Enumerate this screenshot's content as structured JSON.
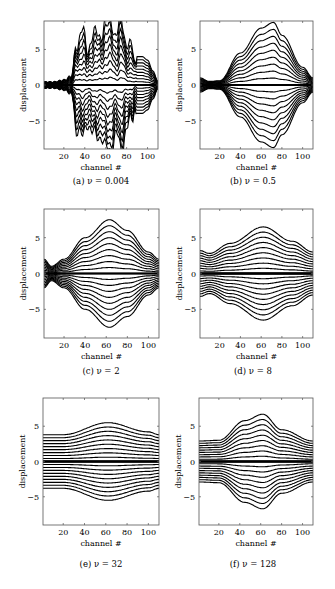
{
  "figure": {
    "panels": [
      {
        "id": "a",
        "caption": "(a) ν = 0.004",
        "box": {
          "x": 44,
          "y": 21,
          "w": 114,
          "h": 128
        },
        "caption_pos": {
          "x": 101,
          "y": 182
        }
      },
      {
        "id": "b",
        "caption": "(b) ν = 0.5",
        "box": {
          "x": 200,
          "y": 21,
          "w": 113,
          "h": 128
        },
        "caption_pos": {
          "x": 253,
          "y": 182
        }
      },
      {
        "id": "c",
        "caption": "(c) ν = 2",
        "box": {
          "x": 44,
          "y": 209,
          "w": 115,
          "h": 129
        },
        "caption_pos": {
          "x": 101,
          "y": 372
        }
      },
      {
        "id": "d",
        "caption": "(d) ν = 8",
        "box": {
          "x": 200,
          "y": 209,
          "w": 113,
          "h": 129
        },
        "caption_pos": {
          "x": 253,
          "y": 372
        }
      },
      {
        "id": "e",
        "caption": "(e) ν = 32",
        "box": {
          "x": 43,
          "y": 398,
          "w": 116,
          "h": 127
        },
        "caption_pos": {
          "x": 101,
          "y": 565
        }
      },
      {
        "id": "f",
        "caption": "(f) ν = 128",
        "box": {
          "x": 199,
          "y": 398,
          "w": 114,
          "h": 127
        },
        "caption_pos": {
          "x": 253,
          "y": 565
        }
      }
    ]
  },
  "chart_data": [
    {
      "type": "line",
      "title": "(a) ν = 0.004",
      "xlabel": "channel #",
      "ylabel": "displacement",
      "xlim": [
        1,
        110
      ],
      "ylim": [
        -9,
        9
      ],
      "xticks": [
        20,
        40,
        60,
        80,
        100
      ],
      "yticks": [
        -5,
        0,
        5
      ],
      "grid": false,
      "legend": null,
      "description": "~20 displacement traces, noisy and irregular; near zero for channels 1-25, large jagged excursions for channels 30-88 (reaching ±9 and clipped), narrow band ±4 for channels 88-108",
      "envelope": {
        "x": [
          1,
          10,
          20,
          28,
          32,
          38,
          42,
          48,
          55,
          60,
          65,
          70,
          75,
          80,
          85,
          88,
          90,
          95,
          100,
          105,
          110
        ],
        "max": [
          0.5,
          0.5,
          0.8,
          1.5,
          6,
          7.5,
          5,
          7,
          7,
          9,
          9,
          7,
          9,
          6,
          5,
          3,
          4,
          4,
          3.5,
          2,
          0.5
        ]
      }
    },
    {
      "type": "line",
      "title": "(b) ν = 0.5",
      "xlabel": "channel #",
      "ylabel": "displacement",
      "xlim": [
        1,
        110
      ],
      "ylim": [
        -9,
        9
      ],
      "xticks": [
        20,
        40,
        60,
        80,
        100
      ],
      "yticks": [
        -5,
        0,
        5
      ],
      "grid": false,
      "legend": null,
      "description": "~20 smooth traces symmetric about 0; bundle narrow (±1) near channels 1-20, widening to ±8.8 near channel 72, then narrowing to ±1 at 110",
      "envelope": {
        "x": [
          1,
          10,
          20,
          40,
          60,
          72,
          80,
          100,
          110
        ],
        "max": [
          1,
          0.5,
          0.6,
          4.5,
          8,
          8.8,
          7,
          2.5,
          1
        ]
      }
    },
    {
      "type": "line",
      "title": "(c) ν = 2",
      "xlabel": "channel #",
      "ylabel": "displacement",
      "xlim": [
        1,
        110
      ],
      "ylim": [
        -9,
        9
      ],
      "xticks": [
        20,
        40,
        60,
        80,
        100
      ],
      "yticks": [
        -5,
        0,
        5
      ],
      "grid": false,
      "legend": null,
      "description": "~20 smooth bell-shaped traces symmetric about 0, peak ±7.5 near channel 63",
      "envelope": {
        "x": [
          1,
          8,
          20,
          40,
          63,
          80,
          100,
          110
        ],
        "max": [
          2,
          1,
          2,
          5,
          7.5,
          6,
          3,
          2
        ]
      }
    },
    {
      "type": "line",
      "title": "(d) ν = 8",
      "xlabel": "channel #",
      "ylabel": "displacement",
      "xlim": [
        1,
        110
      ],
      "ylim": [
        -9,
        9
      ],
      "xticks": [
        20,
        40,
        60,
        80,
        100
      ],
      "yticks": [
        -5,
        0,
        5
      ],
      "grid": false,
      "legend": null,
      "description": "~20 smooth traces, peak ±6.5 near channel 62, edges ±3",
      "envelope": {
        "x": [
          1,
          10,
          30,
          62,
          90,
          110
        ],
        "max": [
          3.2,
          2.8,
          4.2,
          6.5,
          4.5,
          3
        ]
      }
    },
    {
      "type": "line",
      "title": "(e) ν = 32",
      "xlabel": "channel #",
      "ylabel": "displacement",
      "xlim": [
        1,
        110
      ],
      "ylim": [
        -9,
        9
      ],
      "xticks": [
        20,
        40,
        60,
        80,
        100
      ],
      "yticks": [
        -5,
        0,
        5
      ],
      "grid": false,
      "legend": null,
      "description": "~20 nearly flat traces, peak ±5.5 near channel 62, edges ±3.8",
      "envelope": {
        "x": [
          1,
          20,
          62,
          100,
          110
        ],
        "max": [
          3.8,
          3.8,
          5.5,
          4.2,
          3.8
        ]
      }
    },
    {
      "type": "line",
      "title": "(f) ν = 128",
      "xlabel": "channel #",
      "ylabel": "displacement",
      "xlim": [
        1,
        110
      ],
      "ylim": [
        -9,
        9
      ],
      "xticks": [
        20,
        40,
        60,
        80,
        100
      ],
      "yticks": [
        -5,
        0,
        5
      ],
      "grid": false,
      "legend": null,
      "description": "~20 smooth traces, peak ±6.7 near channel 62, edges ±2.9",
      "envelope": {
        "x": [
          1,
          20,
          45,
          62,
          80,
          110
        ],
        "max": [
          2.9,
          3,
          5.8,
          6.7,
          4.5,
          2.9
        ]
      }
    }
  ],
  "axes": {
    "xlabel": "channel #",
    "ylabel": "displacement",
    "xticks": [
      "20",
      "40",
      "60",
      "80",
      "100"
    ],
    "yticks": [
      "5",
      "0",
      "−5"
    ]
  }
}
